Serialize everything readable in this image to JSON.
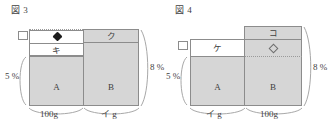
{
  "page": {
    "width": 328,
    "height": 124,
    "background": "#ffffff",
    "fill_color": "#d6d6d6",
    "stroke_color": "#8c8c8c"
  },
  "figures": [
    {
      "id": "fig3",
      "caption": "図 3",
      "left_bracket_label": "5 %",
      "right_bracket_label": "8 %",
      "columns": [
        {
          "id": "A",
          "body_label": "A",
          "bottom_label": "100g",
          "top_marker": "filled-diamond",
          "middle_label": "キ"
        },
        {
          "id": "B",
          "body_label": "B",
          "bottom_label": "イ g",
          "top_label": "ク"
        }
      ]
    },
    {
      "id": "fig4",
      "caption": "図 4",
      "left_bracket_label": "5 %",
      "right_bracket_label": "8 %",
      "columns": [
        {
          "id": "A",
          "body_label": "A",
          "bottom_label": "イ g",
          "middle_label": "ケ"
        },
        {
          "id": "B",
          "body_label": "B",
          "bottom_label": "100g",
          "top_label": "コ",
          "marker": "open-diamond"
        }
      ]
    }
  ]
}
